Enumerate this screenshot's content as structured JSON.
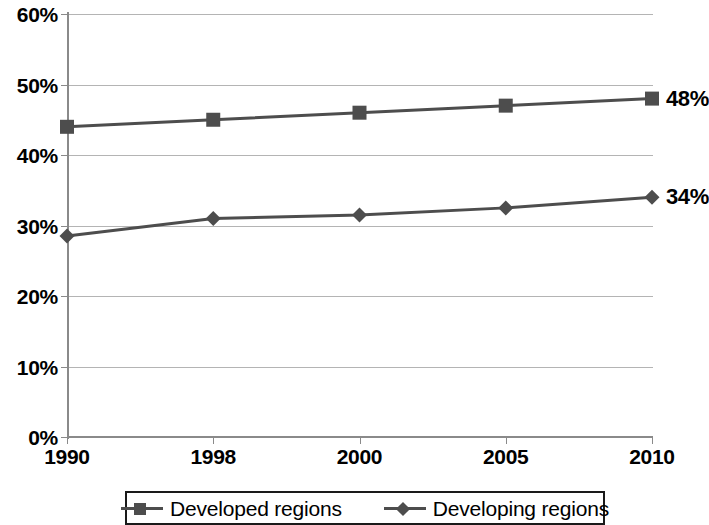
{
  "chart_data": {
    "type": "line",
    "title": "",
    "subtitle": "",
    "xlabel": "",
    "ylabel": "",
    "categories": [
      "1990",
      "1998",
      "2000",
      "2005",
      "2010"
    ],
    "ylim": [
      0,
      60
    ],
    "ytick_labels": [
      "0%",
      "10%",
      "20%",
      "30%",
      "40%",
      "50%",
      "60%"
    ],
    "ytick_values": [
      0,
      10,
      20,
      30,
      40,
      50,
      60
    ],
    "grid": true,
    "legend_position": "bottom",
    "series": [
      {
        "name": "Developed regions",
        "marker": "square",
        "color": "#4d4d4d",
        "values": [
          44,
          45,
          46,
          47,
          48
        ],
        "end_label": "48%"
      },
      {
        "name": "Developing regions",
        "marker": "diamond",
        "color": "#4d4d4d",
        "values": [
          28.5,
          31,
          31.5,
          32.5,
          34
        ],
        "end_label": "34%"
      }
    ],
    "annotations": [
      {
        "text": "48%",
        "series": "Developed regions",
        "category": "2010"
      },
      {
        "text": "34%",
        "series": "Developing regions",
        "category": "2010"
      }
    ]
  },
  "legend": {
    "items": [
      {
        "label": "Developed regions",
        "marker": "square"
      },
      {
        "label": "Developing regions",
        "marker": "diamond"
      }
    ]
  },
  "colors": {
    "line": "#4d4d4d",
    "grid": "#b4b4b4",
    "axis": "#8a8a8a",
    "text": "#000000",
    "background": "#ffffff"
  }
}
